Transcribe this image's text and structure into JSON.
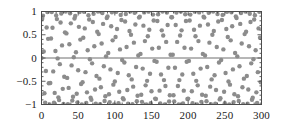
{
  "chart_data": {
    "type": "scatter",
    "title": "",
    "xlabel": "",
    "ylabel": "",
    "xlim": [
      0,
      300
    ],
    "ylim": [
      -1,
      1
    ],
    "grid": false,
    "legend": null,
    "marker": {
      "shape": "circle",
      "color": "#8c8c8c",
      "size_px": 2.2
    },
    "zero_line": {
      "y": 0,
      "color": "#6e6e6e",
      "visible": true
    },
    "axes": {
      "frame_color": "#4d4d4d",
      "tick_direction": "in",
      "ticks_all_sides": true
    },
    "x": {
      "ticks": [
        0,
        50,
        100,
        150,
        200,
        250,
        300
      ],
      "tick_labels": [
        "0",
        "50",
        "100",
        "150",
        "200",
        "250",
        "300"
      ],
      "minor_tick_step": 10
    },
    "y": {
      "ticks": [
        1,
        0.5,
        0,
        -0.5,
        -1
      ],
      "tick_labels": [
        "1",
        "0.5",
        "0",
        "−0.5",
        "−1"
      ],
      "minor_tick_step": 0.1
    },
    "series": [
      {
        "name": "sin(n)",
        "function": "sin",
        "x_start": 0,
        "x_end": 300,
        "x_step": 1,
        "n_points": 301
      }
    ]
  }
}
